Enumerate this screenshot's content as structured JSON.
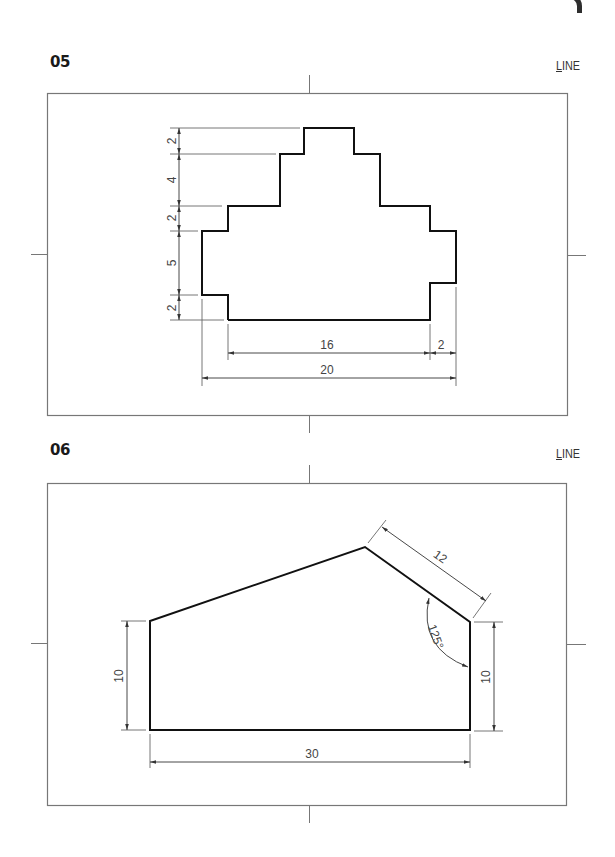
{
  "page": {
    "corner_tab": "page-tab-marker"
  },
  "exercises": [
    {
      "number": "05",
      "command": "LINE",
      "command_hotkey": "L",
      "command_rest": "INE",
      "shape": "stepped-profile",
      "dimensions": {
        "vertical": [
          "2",
          "4",
          "2",
          "5",
          "2"
        ],
        "horizontal_inner": "16",
        "horizontal_step": "2",
        "horizontal_overall": "20"
      }
    },
    {
      "number": "06",
      "command": "LINE",
      "command_hotkey": "L",
      "command_rest": "INE",
      "shape": "pentagon-profile",
      "dimensions": {
        "left_height": "10",
        "right_height": "10",
        "base_width": "30",
        "slant_length": "12",
        "angle": "125°"
      }
    }
  ],
  "colors": {
    "outline": "#111111",
    "dimension": "#555555",
    "frame": "#777777"
  }
}
